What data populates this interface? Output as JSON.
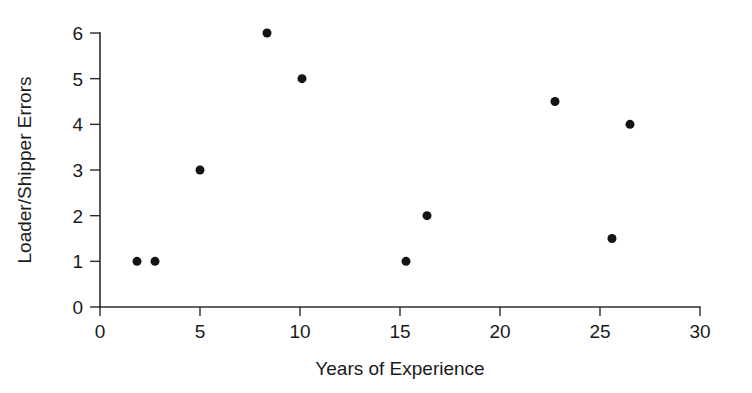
{
  "chart_data": {
    "type": "scatter",
    "title": "",
    "xlabel": "Years of Experience",
    "ylabel": "Loader/Shipper Errors",
    "xlim": [
      0,
      30
    ],
    "ylim": [
      0,
      6
    ],
    "xticks": [
      0,
      5,
      10,
      15,
      20,
      25,
      30
    ],
    "yticks": [
      0,
      1,
      2,
      3,
      4,
      5,
      6
    ],
    "xtick_labels": [
      "0",
      "5",
      "10",
      "15",
      "20",
      "25",
      "30"
    ],
    "ytick_labels": [
      "0",
      "1",
      "2",
      "3",
      "4",
      "5",
      "6"
    ],
    "grid": false,
    "legend": null,
    "marker": "filled-circle",
    "marker_color": "#141414",
    "marker_size": 9,
    "points": [
      {
        "x": 1.85,
        "y": 1.0
      },
      {
        "x": 2.75,
        "y": 1.0
      },
      {
        "x": 5.0,
        "y": 3.0
      },
      {
        "x": 8.35,
        "y": 6.0
      },
      {
        "x": 10.1,
        "y": 5.0
      },
      {
        "x": 15.3,
        "y": 1.0
      },
      {
        "x": 16.35,
        "y": 2.0
      },
      {
        "x": 22.75,
        "y": 4.5
      },
      {
        "x": 25.6,
        "y": 1.5
      },
      {
        "x": 26.5,
        "y": 4.0
      }
    ]
  },
  "figure": {
    "background": "#ffffff",
    "axis_color": "#2b2b2b",
    "text_color": "#1a1a1a"
  }
}
